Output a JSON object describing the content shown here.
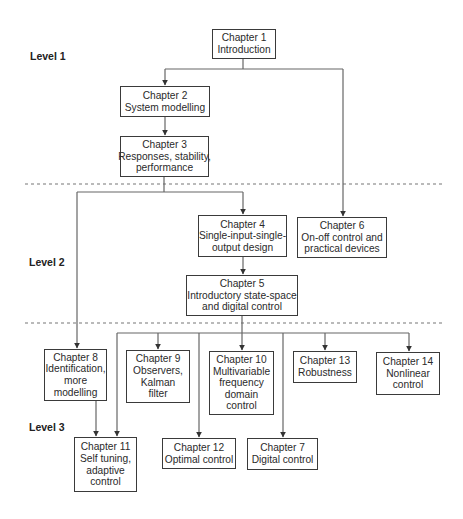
{
  "levels": [
    {
      "label": "Level 1"
    },
    {
      "label": "Level 2"
    },
    {
      "label": "Level 3"
    }
  ],
  "nodes": {
    "ch1": {
      "chapter": "Chapter 1",
      "lines": [
        "Introduction"
      ]
    },
    "ch2": {
      "chapter": "Chapter 2",
      "lines": [
        "System modelling"
      ]
    },
    "ch3": {
      "chapter": "Chapter 3",
      "lines": [
        "Responses, stability,",
        "performance"
      ]
    },
    "ch4": {
      "chapter": "Chapter 4",
      "lines": [
        "Single-input-single-",
        "output design"
      ]
    },
    "ch5": {
      "chapter": "Chapter 5",
      "lines": [
        "Introductory state-space",
        "and digital control"
      ]
    },
    "ch6": {
      "chapter": "Chapter 6",
      "lines": [
        "On-off control and",
        "practical devices"
      ]
    },
    "ch8": {
      "chapter": "Chapter 8",
      "lines": [
        "Identification,",
        "more",
        "modelling"
      ]
    },
    "ch9": {
      "chapter": "Chapter 9",
      "lines": [
        "Observers,",
        "Kalman",
        "filter"
      ]
    },
    "ch10": {
      "chapter": "Chapter 10",
      "lines": [
        "Multivariable",
        "frequency",
        "domain",
        "control"
      ]
    },
    "ch13": {
      "chapter": "Chapter 13",
      "lines": [
        "Robustness"
      ]
    },
    "ch14": {
      "chapter": "Chapter 14",
      "lines": [
        "Nonlinear",
        "control"
      ]
    },
    "ch11": {
      "chapter": "Chapter 11",
      "lines": [
        "Self tuning,",
        "adaptive",
        "control"
      ]
    },
    "ch12": {
      "chapter": "Chapter 12",
      "lines": [
        "Optimal control"
      ]
    },
    "ch7": {
      "chapter": "Chapter 7",
      "lines": [
        "Digital control"
      ]
    }
  },
  "edges": [
    [
      "ch1",
      "ch2"
    ],
    [
      "ch1",
      "ch6"
    ],
    [
      "ch2",
      "ch3"
    ],
    [
      "ch3",
      "ch4"
    ],
    [
      "ch3",
      "ch8"
    ],
    [
      "ch4",
      "ch5"
    ],
    [
      "ch5",
      "ch9"
    ],
    [
      "ch5",
      "ch10"
    ],
    [
      "ch5",
      "ch11"
    ],
    [
      "ch5",
      "ch12"
    ],
    [
      "ch5",
      "ch7"
    ],
    [
      "ch5",
      "ch13"
    ],
    [
      "ch5",
      "ch14"
    ],
    [
      "ch8",
      "ch11"
    ]
  ],
  "colors": {
    "line": "#555555",
    "box_border": "#3a3a3a",
    "text": "#2a2a2a",
    "background": "#ffffff"
  }
}
